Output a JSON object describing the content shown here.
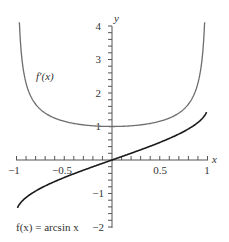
{
  "chart_data": {
    "type": "line",
    "title": "",
    "xlabel": "x",
    "ylabel": "y",
    "xlim": [
      -1,
      1
    ],
    "ylim": [
      -2,
      4
    ],
    "x_ticks": [
      -1,
      -0.5,
      0.5,
      1
    ],
    "x_tick_labels": [
      "−1",
      "−0.5",
      "0.5",
      "1"
    ],
    "y_ticks": [
      -2,
      -1,
      1,
      2,
      3,
      4
    ],
    "y_tick_labels": [
      "−2",
      "−1",
      "1",
      "2",
      "3",
      "4"
    ],
    "grid": false,
    "legend": null,
    "series": [
      {
        "name": "f'(x)",
        "label": "f′(x)",
        "expression": "1/sqrt(1-x^2)",
        "color": "#6e6e6e",
        "x": [
          -0.97,
          -0.95,
          -0.9,
          -0.8,
          -0.6,
          -0.4,
          -0.2,
          0,
          0.2,
          0.4,
          0.6,
          0.8,
          0.9,
          0.95,
          0.97
        ],
        "values": [
          4.11,
          3.2,
          2.29,
          1.67,
          1.25,
          1.09,
          1.02,
          1.0,
          1.02,
          1.09,
          1.25,
          1.67,
          2.29,
          3.2,
          4.11
        ]
      },
      {
        "name": "f(x)",
        "label": "f(x) = arcsin x",
        "expression": "arcsin(x)",
        "color": "#1a1a1a",
        "x": [
          -0.99,
          -0.95,
          -0.9,
          -0.8,
          -0.6,
          -0.4,
          -0.2,
          0,
          0.2,
          0.4,
          0.6,
          0.8,
          0.9,
          0.95,
          0.99
        ],
        "values": [
          -1.43,
          -1.25,
          -1.12,
          -0.93,
          -0.64,
          -0.41,
          -0.2,
          0,
          0.2,
          0.41,
          0.64,
          0.93,
          1.12,
          1.25,
          1.43
        ]
      }
    ],
    "annotations": [
      {
        "text": "f′(x)",
        "near": "left branch of derivative curve"
      },
      {
        "text": "f(x) = arcsin x",
        "near": "bottom-left"
      }
    ]
  },
  "labels": {
    "x_axis": "x",
    "y_axis": "y",
    "derivative": "f′(x)",
    "function": "f(x) = arcsin x",
    "xt_m1": "−1",
    "xt_m05": "−0.5",
    "xt_05": "0.5",
    "xt_1": "1",
    "yt_4": "4",
    "yt_3": "3",
    "yt_2": "2",
    "yt_1": "1",
    "yt_m1": "−1",
    "yt_m2": "−2"
  }
}
